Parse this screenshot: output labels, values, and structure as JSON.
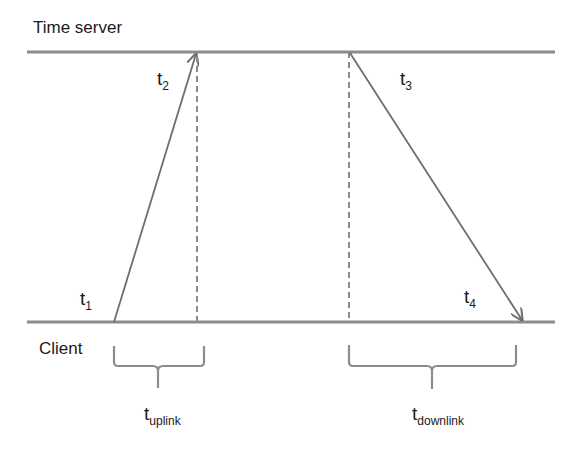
{
  "diagram": {
    "lanes": {
      "server_label": "Time server",
      "client_label": "Client"
    },
    "timestamps": [
      {
        "id": "t1",
        "base": "t",
        "sub": "1"
      },
      {
        "id": "t2",
        "base": "t",
        "sub": "2"
      },
      {
        "id": "t3",
        "base": "t",
        "sub": "3"
      },
      {
        "id": "t4",
        "base": "t",
        "sub": "4"
      }
    ],
    "intervals": [
      {
        "id": "uplink",
        "base": "t",
        "sub": "uplink"
      },
      {
        "id": "downlink",
        "base": "t",
        "sub": "downlink"
      }
    ],
    "colors": {
      "line": "#8c8c8c",
      "arrow": "#6e6e6e",
      "text": "#1a1a1a"
    }
  }
}
